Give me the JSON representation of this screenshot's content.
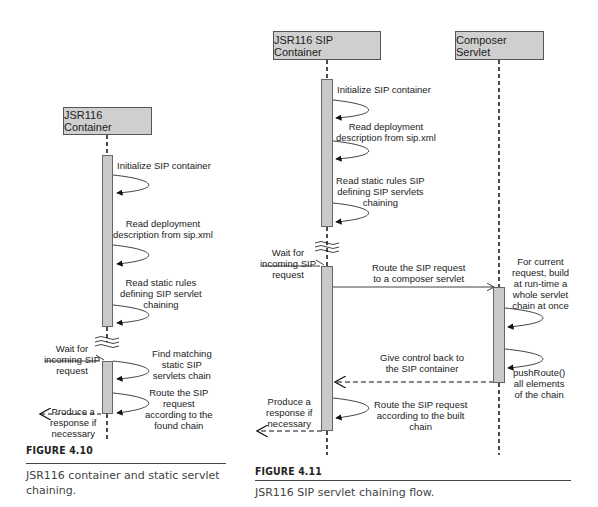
{
  "figure_4_10": {
    "participant": "JSR116 Container",
    "messages": [
      "Initialize SIP container",
      "Read deployment\ndescription from sip.xml",
      "Read static rules\ndefining SIP servlet\nchaining",
      "Find matching\nstatic SIP\nservlets chain",
      "Route the SIP\nrequest\naccording to the\nfound chain"
    ],
    "wait_label": "Wait for\nincoming SIP\nrequest",
    "response_label": "Produce a\nresponse if\nnecessary",
    "figure_label": "FIGURE 4.10",
    "caption": "JSR116 container and static servlet\nchaining."
  },
  "figure_4_11": {
    "participants": [
      "JSR116 SIP Container",
      "Composer Servlet"
    ],
    "messages": {
      "init": "Initialize SIP container",
      "read_deploy": "Read deployment\ndescription from sip.xml",
      "read_rules": "Read static rules SIP\ndefining SIP servlets\nchaining",
      "route_to_composer": "Route the SIP request\nto a composer servlet",
      "build_chain": "For current\nrequest, build\nat run-time a\nwhole servlet\nchain at once",
      "push_route": "pushRoute()\nall elements\nof the chain",
      "give_back": "Give control back to\nthe SIP container",
      "route_built": "Route the SIP request\naccording to the built\nchain"
    },
    "wait_label": "Wait for\nincoming SIP\nrequest",
    "response_label": "Produce a\nresponse if\nnecessary",
    "figure_label": "FIGURE 4.11",
    "caption": "JSR116 SIP servlet chaining flow."
  }
}
